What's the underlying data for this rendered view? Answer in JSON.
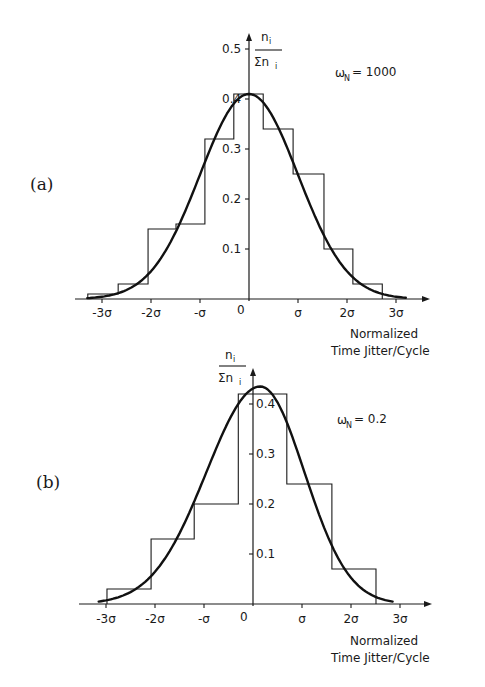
{
  "figure": {
    "panels": [
      {
        "id": "a",
        "label": "(a)"
      },
      {
        "id": "b",
        "label": "(b)"
      }
    ]
  },
  "chart_data": [
    {
      "type": "bar",
      "panel_label": "(a)",
      "title": "",
      "annotation": "ωN = 1000",
      "annotation_symbol": "ω",
      "annotation_subscript": "N",
      "annotation_value": "= 1000",
      "xlabel": "Normalized Time Jitter/Cycle",
      "xlabel_lines": [
        "Normalized",
        "Time Jitter/Cycle"
      ],
      "ylabel": "n_i / Σn_i",
      "ylabel_num": "n",
      "ylabel_den": "Σn",
      "ylabel_sub": "i",
      "xticks": [
        "-3σ",
        "-2σ",
        "-σ",
        "0",
        "σ",
        "2σ",
        "3σ"
      ],
      "xtick_values": [
        -3,
        -2,
        -1,
        0,
        1,
        2,
        3
      ],
      "yticks": [
        "0.1",
        "0.2",
        "0.3",
        "0.4",
        "0.5"
      ],
      "ytick_values": [
        0.1,
        0.2,
        0.3,
        0.4,
        0.5
      ],
      "ylim": [
        0,
        0.52
      ],
      "xlim": [
        -3.7,
        3.9
      ],
      "histogram_bin_edges_sigma": [
        -3.29,
        -2.67,
        -2.06,
        -1.49,
        -0.9,
        -0.31,
        0.29,
        0.9,
        1.53,
        2.12,
        2.72
      ],
      "histogram_values": [
        0.01,
        0.03,
        0.14,
        0.15,
        0.32,
        0.41,
        0.34,
        0.25,
        0.1,
        0.03
      ],
      "fit_curve": {
        "kind": "gaussian",
        "mean_sigma": 0.0,
        "peak": 0.41,
        "sd_sigma": 1.0,
        "range_sigma": [
          -3.3,
          3.2
        ]
      },
      "grid": false,
      "legend": "none"
    },
    {
      "type": "bar",
      "panel_label": "(b)",
      "title": "",
      "annotation": "ωN = 0.2",
      "annotation_symbol": "ω",
      "annotation_subscript": "N",
      "annotation_value": "= 0.2",
      "xlabel": "Normalized Time Jitter/Cycle",
      "xlabel_lines": [
        "Normalized",
        "Time Jitter/Cycle"
      ],
      "ylabel": "n_i / Σn_i",
      "ylabel_num": "n",
      "ylabel_den": "Σn",
      "ylabel_sub": "i",
      "xticks": [
        "-3σ",
        "-2σ",
        "-σ",
        "0",
        "σ",
        "2σ",
        "3σ"
      ],
      "xtick_values": [
        -3,
        -2,
        -1,
        0,
        1,
        2,
        3
      ],
      "yticks": [
        "0.1",
        "0.2",
        "0.3",
        "0.4"
      ],
      "ytick_values": [
        0.1,
        0.2,
        0.3,
        0.4
      ],
      "ylim": [
        0,
        0.45
      ],
      "xlim": [
        -3.6,
        3.9
      ],
      "histogram_bin_edges_sigma": [
        -2.98,
        -2.08,
        -1.2,
        -0.3,
        0.69,
        1.61,
        2.51
      ],
      "histogram_values": [
        0.03,
        0.13,
        0.2,
        0.42,
        0.24,
        0.07
      ],
      "fit_curve": {
        "kind": "skewed-gaussian",
        "mean_sigma": 0.15,
        "peak": 0.435,
        "sd_left_sigma": 1.1,
        "sd_right_sigma": 0.9,
        "range_sigma": [
          -3.15,
          2.85
        ]
      },
      "grid": false,
      "legend": "none"
    }
  ]
}
